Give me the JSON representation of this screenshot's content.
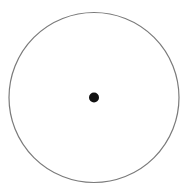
{
  "diagram": {
    "type": "circle-with-center-point",
    "canvas": {
      "width": 187,
      "height": 188,
      "background": "#ffffff"
    },
    "circle": {
      "cx": 94,
      "cy": 97.5,
      "r": 85,
      "stroke": "#7a7a7a",
      "stroke_width": 1.2,
      "fill": "none"
    },
    "center_point": {
      "cx": 94,
      "cy": 97.5,
      "r": 5,
      "fill": "#111111"
    }
  }
}
